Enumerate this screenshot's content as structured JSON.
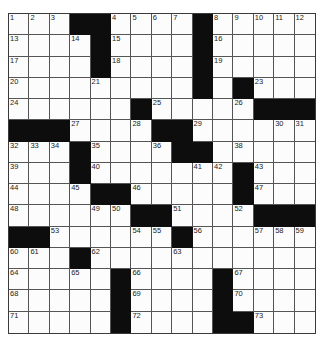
{
  "puzzle": {
    "type": "crossword",
    "rows": 15,
    "cols": 15,
    "colors": {
      "block": "#0d0d0d",
      "cell": "#fcfcfc",
      "line": "#555555"
    },
    "grid": [
      "...##....#.....",
      "....#....#.....",
      "....#....#.....",
      ".........#.#...",
      "......#.....###",
      "###....##......",
      "...#....##.....",
      "...#.......#...",
      "....##.....#...",
      "......##....###",
      "##......#......",
      "...#...........",
      ".....#....#....",
      ".....#....#....",
      ".....#....##..."
    ],
    "numbers": [
      [
        1,
        1,
        1
      ],
      [
        1,
        2,
        2
      ],
      [
        1,
        3,
        3
      ],
      [
        1,
        6,
        4
      ],
      [
        1,
        7,
        5
      ],
      [
        1,
        8,
        6
      ],
      [
        1,
        9,
        7
      ],
      [
        1,
        11,
        8
      ],
      [
        1,
        12,
        9
      ],
      [
        1,
        13,
        10
      ],
      [
        1,
        14,
        11
      ],
      [
        1,
        15,
        12
      ],
      [
        2,
        1,
        13
      ],
      [
        2,
        4,
        14
      ],
      [
        2,
        6,
        15
      ],
      [
        2,
        11,
        16
      ],
      [
        3,
        1,
        17
      ],
      [
        3,
        6,
        18
      ],
      [
        3,
        11,
        19
      ],
      [
        4,
        1,
        20
      ],
      [
        4,
        5,
        21
      ],
      [
        4,
        10,
        22
      ],
      [
        4,
        13,
        23
      ],
      [
        5,
        1,
        24
      ],
      [
        5,
        8,
        25
      ],
      [
        5,
        12,
        26
      ],
      [
        6,
        4,
        27
      ],
      [
        6,
        7,
        28
      ],
      [
        6,
        10,
        29
      ],
      [
        6,
        14,
        30
      ],
      [
        6,
        15,
        31
      ],
      [
        7,
        1,
        32
      ],
      [
        7,
        2,
        33
      ],
      [
        7,
        3,
        34
      ],
      [
        7,
        5,
        35
      ],
      [
        7,
        8,
        36
      ],
      [
        7,
        9,
        37
      ],
      [
        7,
        12,
        38
      ],
      [
        8,
        1,
        39
      ],
      [
        8,
        5,
        40
      ],
      [
        8,
        10,
        41
      ],
      [
        8,
        11,
        42
      ],
      [
        8,
        13,
        43
      ],
      [
        9,
        1,
        44
      ],
      [
        9,
        4,
        45
      ],
      [
        9,
        7,
        46
      ],
      [
        9,
        13,
        47
      ],
      [
        10,
        1,
        48
      ],
      [
        10,
        5,
        49
      ],
      [
        10,
        6,
        50
      ],
      [
        10,
        9,
        51
      ],
      [
        10,
        12,
        52
      ],
      [
        11,
        3,
        53
      ],
      [
        11,
        7,
        54
      ],
      [
        11,
        8,
        55
      ],
      [
        11,
        10,
        56
      ],
      [
        11,
        13,
        57
      ],
      [
        11,
        14,
        58
      ],
      [
        11,
        15,
        59
      ],
      [
        12,
        1,
        60
      ],
      [
        12,
        2,
        61
      ],
      [
        12,
        5,
        62
      ],
      [
        12,
        9,
        63
      ],
      [
        13,
        1,
        64
      ],
      [
        13,
        4,
        65
      ],
      [
        13,
        7,
        66
      ],
      [
        13,
        12,
        67
      ],
      [
        14,
        1,
        68
      ],
      [
        14,
        7,
        69
      ],
      [
        14,
        12,
        70
      ],
      [
        15,
        1,
        71
      ],
      [
        15,
        7,
        72
      ],
      [
        15,
        13,
        73
      ]
    ]
  }
}
